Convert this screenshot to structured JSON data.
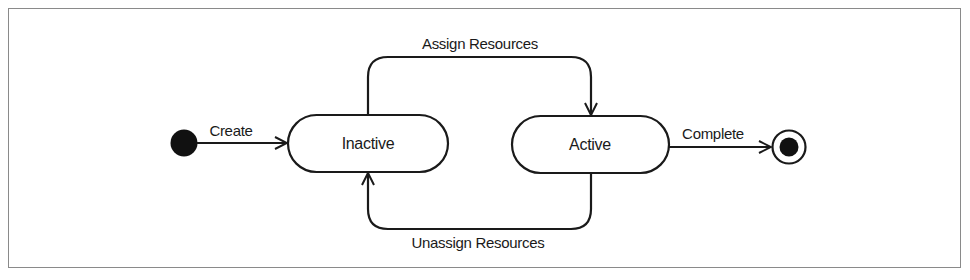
{
  "diagram": {
    "type": "uml-state-machine",
    "states": [
      {
        "id": "initial",
        "kind": "initial-pseudostate"
      },
      {
        "id": "inactive",
        "kind": "state",
        "label": "Inactive"
      },
      {
        "id": "active",
        "kind": "state",
        "label": "Active"
      },
      {
        "id": "final",
        "kind": "final-state"
      }
    ],
    "transitions": [
      {
        "from": "initial",
        "to": "inactive",
        "label": "Create"
      },
      {
        "from": "inactive",
        "to": "active",
        "label": "Assign Resources"
      },
      {
        "from": "active",
        "to": "inactive",
        "label": "Unassign Resources"
      },
      {
        "from": "active",
        "to": "final",
        "label": "Complete"
      }
    ],
    "colors": {
      "stroke": "#1a1a1a",
      "frame": "#8a8a8a",
      "background": "#ffffff"
    }
  }
}
